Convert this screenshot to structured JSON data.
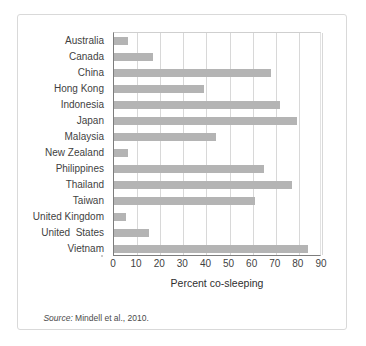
{
  "figure": {
    "source_note_label": "Source:",
    "source_note_text": " Mindell et al., 2010."
  },
  "chart_data": {
    "type": "bar",
    "orientation": "horizontal",
    "title": "",
    "xlabel": "Percent co-sleeping",
    "ylabel": "",
    "xlim": [
      0,
      90
    ],
    "ylim": null,
    "grid": "vertical",
    "legend": "none",
    "bar_color": "#b4b4b4",
    "xticks": [
      0,
      10,
      20,
      30,
      40,
      50,
      60,
      70,
      80,
      90
    ],
    "xtick_labels": [
      "0",
      "10",
      "20",
      "30",
      "40",
      "50",
      "60",
      "70",
      "80",
      "90"
    ],
    "categories": [
      "Australia",
      "Canada",
      "China",
      "Hong Kong",
      "Indonesia",
      "Japan",
      "Malaysia",
      "New Zealand",
      "Philippines",
      "Thailand",
      "Taiwan",
      "United Kingdom",
      "United  States",
      "Vietnam"
    ],
    "values": [
      6,
      17,
      68,
      39,
      72,
      79,
      44,
      6,
      65,
      77,
      61,
      5,
      15,
      84
    ],
    "series": [
      {
        "name": "Percent co-sleeping",
        "values": [
          6,
          17,
          68,
          39,
          72,
          79,
          44,
          6,
          65,
          77,
          61,
          5,
          15,
          84
        ]
      }
    ]
  }
}
